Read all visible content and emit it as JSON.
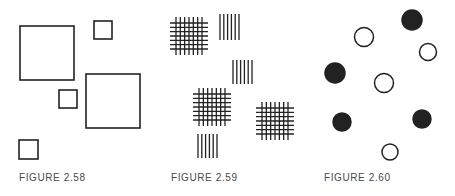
{
  "figures": [
    {
      "caption": "FIGURE 2.58",
      "description": "Squares of two sizes (large and small) scattered",
      "shapes": [
        {
          "type": "square",
          "size": "large",
          "x": 20,
          "y": 26,
          "w": 54
        },
        {
          "type": "square",
          "size": "small",
          "x": 94,
          "y": 21,
          "w": 18
        },
        {
          "type": "square",
          "size": "small",
          "x": 59,
          "y": 90,
          "w": 18
        },
        {
          "type": "square",
          "size": "large",
          "x": 86,
          "y": 74,
          "w": 54
        },
        {
          "type": "square",
          "size": "small",
          "x": 19,
          "y": 140,
          "w": 19
        }
      ]
    },
    {
      "caption": "FIGURE 2.59",
      "description": "Crosshatch grids and groups of vertical lines",
      "shapes": [
        {
          "type": "grid",
          "x": 170,
          "y": 17,
          "w": 38
        },
        {
          "type": "vlines",
          "x": 219,
          "y": 14,
          "w": 21,
          "h": 26
        },
        {
          "type": "vlines",
          "x": 232,
          "y": 60,
          "w": 21,
          "h": 24
        },
        {
          "type": "grid",
          "x": 193,
          "y": 88,
          "w": 38
        },
        {
          "type": "grid",
          "x": 256,
          "y": 102,
          "w": 38
        },
        {
          "type": "vlines",
          "x": 197,
          "y": 134,
          "w": 21,
          "h": 24
        }
      ]
    },
    {
      "caption": "FIGURE 2.60",
      "description": "Filled and open circles scattered",
      "shapes": [
        {
          "type": "circle",
          "filled": true,
          "cx": 412,
          "cy": 20,
          "r": 10
        },
        {
          "type": "circle",
          "filled": false,
          "cx": 364,
          "cy": 37,
          "r": 9.5
        },
        {
          "type": "circle",
          "filled": false,
          "cx": 428,
          "cy": 52,
          "r": 8.5
        },
        {
          "type": "circle",
          "filled": true,
          "cx": 335,
          "cy": 73,
          "r": 10
        },
        {
          "type": "circle",
          "filled": false,
          "cx": 384,
          "cy": 83,
          "r": 9.5
        },
        {
          "type": "circle",
          "filled": true,
          "cx": 342,
          "cy": 122,
          "r": 9
        },
        {
          "type": "circle",
          "filled": true,
          "cx": 422,
          "cy": 119,
          "r": 9
        },
        {
          "type": "circle",
          "filled": false,
          "cx": 390,
          "cy": 152,
          "r": 8
        }
      ]
    }
  ],
  "colors": {
    "ink": "#222222",
    "caption": "#4a4a4a",
    "background": "#ffffff"
  }
}
